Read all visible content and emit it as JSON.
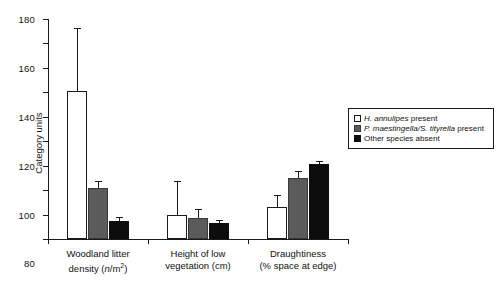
{
  "chart_data": {
    "type": "bar",
    "title": "",
    "xlabel": "",
    "ylabel": "Category units",
    "ylim": [
      0,
      180
    ],
    "yticks": [
      0,
      20,
      40,
      60,
      80,
      100,
      120,
      140,
      160,
      180
    ],
    "grid": false,
    "legend_position": "right",
    "categories": [
      "Woodland litter density (n/m2)",
      "Height of low vegetation (cm)",
      "Draughtiness (% space at edge)"
    ],
    "category_lines": [
      {
        "line1": "Woodland litter",
        "line2_pre": "density (",
        "line2_italic": "n",
        "line2_post": "/m",
        "line2_sup": "2",
        "line2_end": ")"
      },
      {
        "line1": "Height of low",
        "line2_pre": "vegetation (cm)",
        "line2_italic": "",
        "line2_post": "",
        "line2_sup": "",
        "line2_end": ""
      },
      {
        "line1": "Draughtiness",
        "line2_pre": "(% space at edge)",
        "line2_italic": "",
        "line2_post": "",
        "line2_sup": "",
        "line2_end": ""
      }
    ],
    "series": [
      {
        "name": "H. annulipes present",
        "color": "#ffffff",
        "values": [
          121,
          20,
          26
        ],
        "errors_upper": [
          51,
          27,
          9
        ]
      },
      {
        "name": "P. maestingella/S. tityrella present",
        "color": "#5b5b5b",
        "values": [
          42,
          17,
          50
        ],
        "errors_upper": [
          5,
          7,
          5
        ]
      },
      {
        "name": "Other species absent",
        "color": "#0d0d0d",
        "values": [
          15,
          13,
          61
        ],
        "errors_upper": [
          2,
          2,
          2
        ]
      }
    ]
  },
  "legend": {
    "entries": [
      {
        "label_italic": "H. annulipes",
        "label_rest": " present",
        "swatch": "white-open-square"
      },
      {
        "label_italic": "P. maestingella/S. tityrella",
        "label_rest": " present",
        "swatch": "gray-filled-square"
      },
      {
        "label_italic": "",
        "label_rest": "Other species absent",
        "swatch": "black-filled-square"
      }
    ]
  },
  "axis": {
    "y_label": "Category units",
    "y_tick_labels": [
      "0",
      "20",
      "40",
      "60",
      "80",
      "100",
      "120",
      "140",
      "160",
      "180"
    ]
  }
}
